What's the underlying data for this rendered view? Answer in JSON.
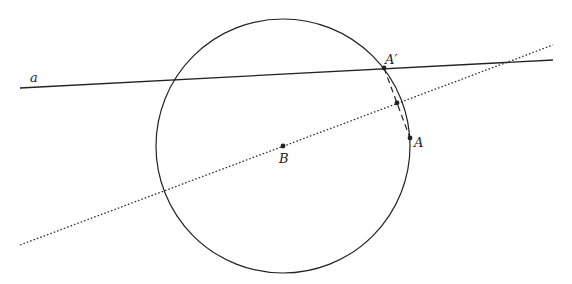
{
  "diagram": {
    "type": "geometry-reflection",
    "circle": {
      "cx": 283,
      "cy": 146,
      "r": 127,
      "stroke": "#222222"
    },
    "line_a": {
      "x1": 20,
      "y1": 88,
      "x2": 553,
      "y2": 60,
      "label": "a",
      "label_x": 30,
      "label_y": 82
    },
    "axis_line": {
      "x1": 20,
      "y1": 245,
      "x2": 553,
      "y2": 45,
      "style": "dotted"
    },
    "points": {
      "B": {
        "x": 283,
        "y": 146,
        "label": "B",
        "label_x": 279,
        "label_y": 163
      },
      "A": {
        "x": 410,
        "y": 138,
        "label": "A",
        "label_x": 414,
        "label_y": 147
      },
      "A_prime": {
        "x": 384,
        "y": 68,
        "label": "A′",
        "label_x": 385,
        "label_y": 64
      },
      "M": {
        "x": 397,
        "y": 103
      }
    },
    "segment_AA_prime": {
      "style": "dashed"
    }
  }
}
